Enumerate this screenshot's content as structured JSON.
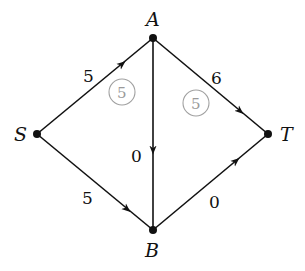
{
  "diagram": {
    "type": "network-flow",
    "nodes": [
      {
        "id": "S",
        "label": "S",
        "x": 37,
        "y": 134
      },
      {
        "id": "A",
        "label": "A",
        "x": 153,
        "y": 38
      },
      {
        "id": "B",
        "label": "B",
        "x": 153,
        "y": 230
      },
      {
        "id": "T",
        "label": "T",
        "x": 268,
        "y": 134
      }
    ],
    "edges": [
      {
        "from": "S",
        "to": "A",
        "weight": "5"
      },
      {
        "from": "S",
        "to": "B",
        "weight": "5"
      },
      {
        "from": "A",
        "to": "B",
        "weight": "0"
      },
      {
        "from": "A",
        "to": "T",
        "weight": "6"
      },
      {
        "from": "B",
        "to": "T",
        "weight": "0"
      }
    ],
    "circled_labels": [
      {
        "near_edge": "S-A",
        "value": "5"
      },
      {
        "near_edge": "A-T",
        "value": "5"
      }
    ],
    "colors": {
      "edge": "#111111",
      "circle": "#a0a0a0"
    }
  }
}
